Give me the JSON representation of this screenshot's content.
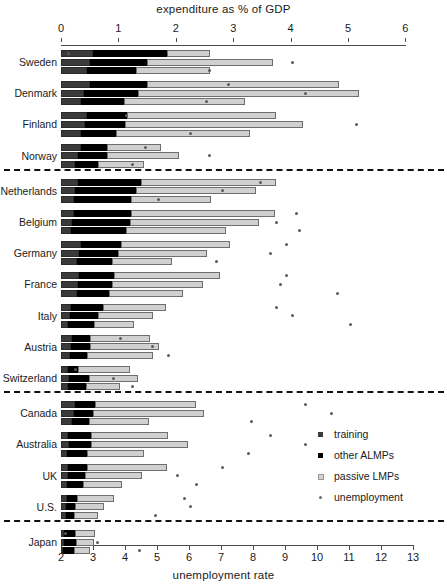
{
  "titles": {
    "top": "expenditure as % of GDP",
    "bottom": "unemployment rate"
  },
  "legend": {
    "items": [
      {
        "key": "training",
        "label": "training"
      },
      {
        "key": "other_almps",
        "label": "other ALMPs"
      },
      {
        "key": "passive_lmps",
        "label": "passive LMPs"
      },
      {
        "key": "unemployment",
        "label": "unemployment"
      }
    ]
  },
  "axes": {
    "top": {
      "label": "expenditure as % of GDP",
      "ticks": [
        0,
        1,
        2,
        3,
        4,
        5,
        6
      ],
      "min": 0,
      "max": 6
    },
    "bottom": {
      "label": "unemployment rate",
      "ticks": [
        2,
        3,
        4,
        5,
        6,
        7,
        8,
        9,
        10,
        11,
        12,
        13
      ],
      "min": 2,
      "max": 13
    }
  },
  "colors": {
    "training": "#3a3a3a",
    "other_almps": "#000000",
    "passive_lmps": "#d0d0d0",
    "unemployment": "#5a5a5a",
    "axis": "#4a4a4a",
    "separator": "#111111",
    "background": "#ffffff"
  },
  "groups": [
    {
      "name": "nordic",
      "countries": [
        "Sweden",
        "Denmark",
        "Finland",
        "Norway"
      ]
    },
    {
      "name": "continental",
      "countries": [
        "Netherlands",
        "Belgium",
        "Germany",
        "France",
        "Italy",
        "Austria",
        "Switzerland"
      ]
    },
    {
      "name": "anglo",
      "countries": [
        "Canada",
        "Australia",
        "UK",
        "U.S."
      ]
    },
    {
      "name": "japan",
      "countries": [
        "Japan"
      ]
    }
  ],
  "chart_data": {
    "type": "bar",
    "orientation": "horizontal",
    "title": "expenditure as % of GDP",
    "xlabel": "expenditure as % of GDP",
    "xlabel_secondary": "unemployment rate",
    "ylabel": "",
    "xlim": [
      0,
      6
    ],
    "xlim_secondary": [
      2,
      13
    ],
    "grid": false,
    "legend_position": "right-middle",
    "stacked": true,
    "series": [
      {
        "name": "training",
        "color": "#3a3a3a"
      },
      {
        "name": "other ALMPs",
        "color": "#000000"
      },
      {
        "name": "passive LMPs",
        "color": "#d0d0d0"
      }
    ],
    "marker_series": {
      "name": "unemployment",
      "color": "#5a5a5a",
      "axis": "bottom"
    },
    "categories": [
      "Sweden",
      "Denmark",
      "Finland",
      "Norway",
      "Netherlands",
      "Belgium",
      "Germany",
      "France",
      "Italy",
      "Austria",
      "Switzerland",
      "Canada",
      "Australia",
      "UK",
      "U.S.",
      "Japan"
    ],
    "bars_per_category": 3,
    "data": [
      {
        "country": "Sweden",
        "bars": [
          {
            "training": 0.55,
            "other_almps": 1.3,
            "passive_lmps": 0.75,
            "unemployment": 2.2
          },
          {
            "training": 0.5,
            "other_almps": 1.0,
            "passive_lmps": 2.2,
            "unemployment": 9.2
          },
          {
            "training": 0.45,
            "other_almps": 0.85,
            "passive_lmps": 1.3,
            "unemployment": 6.6
          }
        ]
      },
      {
        "country": "Denmark",
        "bars": [
          {
            "training": 0.5,
            "other_almps": 1.0,
            "passive_lmps": 3.35,
            "unemployment": 7.2
          },
          {
            "training": 0.4,
            "other_almps": 0.95,
            "passive_lmps": 3.85,
            "unemployment": 9.6
          },
          {
            "training": 0.35,
            "other_almps": 0.75,
            "passive_lmps": 2.1,
            "unemployment": 6.5
          }
        ]
      },
      {
        "country": "Finland",
        "bars": [
          {
            "training": 0.45,
            "other_almps": 0.7,
            "passive_lmps": 2.6,
            "unemployment": 4.0
          },
          {
            "training": 0.42,
            "other_almps": 0.7,
            "passive_lmps": 3.1,
            "unemployment": 11.2
          },
          {
            "training": 0.35,
            "other_almps": 0.6,
            "passive_lmps": 2.35,
            "unemployment": 6.0
          }
        ]
      },
      {
        "country": "Norway",
        "bars": [
          {
            "training": 0.35,
            "other_almps": 0.45,
            "passive_lmps": 0.95,
            "unemployment": 4.6
          },
          {
            "training": 0.3,
            "other_almps": 0.5,
            "passive_lmps": 1.25,
            "unemployment": 6.6
          },
          {
            "training": 0.25,
            "other_almps": 0.4,
            "passive_lmps": 0.8,
            "unemployment": 4.2
          }
        ]
      },
      {
        "country": "Netherlands",
        "bars": [
          {
            "training": 0.3,
            "other_almps": 1.1,
            "passive_lmps": 2.35,
            "unemployment": 8.2
          },
          {
            "training": 0.25,
            "other_almps": 1.05,
            "passive_lmps": 2.1,
            "unemployment": 7.0
          },
          {
            "training": 0.22,
            "other_almps": 1.0,
            "passive_lmps": 1.4,
            "unemployment": 5.0
          }
        ]
      },
      {
        "country": "Belgium",
        "bars": [
          {
            "training": 0.22,
            "other_almps": 1.0,
            "passive_lmps": 2.5,
            "unemployment": 9.3
          },
          {
            "training": 0.2,
            "other_almps": 1.0,
            "passive_lmps": 2.25,
            "unemployment": 8.7
          },
          {
            "training": 0.18,
            "other_almps": 0.95,
            "passive_lmps": 1.75,
            "unemployment": 9.4
          }
        ]
      },
      {
        "country": "Germany",
        "bars": [
          {
            "training": 0.35,
            "other_almps": 0.7,
            "passive_lmps": 1.9,
            "unemployment": 9.0
          },
          {
            "training": 0.32,
            "other_almps": 0.68,
            "passive_lmps": 1.55,
            "unemployment": 8.5
          },
          {
            "training": 0.28,
            "other_almps": 0.6,
            "passive_lmps": 1.05,
            "unemployment": 6.8
          }
        ]
      },
      {
        "country": "France",
        "bars": [
          {
            "training": 0.32,
            "other_almps": 0.6,
            "passive_lmps": 1.85,
            "unemployment": 9.0
          },
          {
            "training": 0.3,
            "other_almps": 0.58,
            "passive_lmps": 1.6,
            "unemployment": 8.8
          },
          {
            "training": 0.28,
            "other_almps": 0.55,
            "passive_lmps": 1.3,
            "unemployment": 10.6
          }
        ]
      },
      {
        "country": "Italy",
        "bars": [
          {
            "training": 0.18,
            "other_almps": 0.55,
            "passive_lmps": 1.1,
            "unemployment": 8.7
          },
          {
            "training": 0.15,
            "other_almps": 0.5,
            "passive_lmps": 0.95,
            "unemployment": 9.2
          },
          {
            "training": 0.12,
            "other_almps": 0.45,
            "passive_lmps": 0.7,
            "unemployment": 11.0
          }
        ]
      },
      {
        "country": "Austria",
        "bars": [
          {
            "training": 0.2,
            "other_almps": 0.3,
            "passive_lmps": 1.05,
            "unemployment": 3.8
          },
          {
            "training": 0.18,
            "other_almps": 0.32,
            "passive_lmps": 1.2,
            "unemployment": 4.8
          },
          {
            "training": 0.16,
            "other_almps": 0.3,
            "passive_lmps": 1.15,
            "unemployment": 5.3
          }
        ]
      },
      {
        "country": "Switzerland",
        "bars": [
          {
            "training": 0.12,
            "other_almps": 0.18,
            "passive_lmps": 0.9,
            "unemployment": 2.4
          },
          {
            "training": 0.14,
            "other_almps": 0.35,
            "passive_lmps": 0.85,
            "unemployment": 3.6
          },
          {
            "training": 0.13,
            "other_almps": 0.3,
            "passive_lmps": 0.6,
            "unemployment": 4.2
          }
        ]
      },
      {
        "country": "Canada",
        "bars": [
          {
            "training": 0.25,
            "other_almps": 0.35,
            "passive_lmps": 1.75,
            "unemployment": 9.6
          },
          {
            "training": 0.23,
            "other_almps": 0.32,
            "passive_lmps": 1.95,
            "unemployment": 10.4
          },
          {
            "training": 0.2,
            "other_almps": 0.28,
            "passive_lmps": 1.05,
            "unemployment": 7.9
          }
        ]
      },
      {
        "country": "Australia",
        "bars": [
          {
            "training": 0.12,
            "other_almps": 0.4,
            "passive_lmps": 1.35,
            "unemployment": 8.5
          },
          {
            "training": 0.14,
            "other_almps": 0.38,
            "passive_lmps": 1.7,
            "unemployment": 9.6
          },
          {
            "training": 0.11,
            "other_almps": 0.34,
            "passive_lmps": 1.0,
            "unemployment": 7.8
          }
        ]
      },
      {
        "country": "UK",
        "bars": [
          {
            "training": 0.13,
            "other_almps": 0.32,
            "passive_lmps": 1.4,
            "unemployment": 7.0
          },
          {
            "training": 0.12,
            "other_almps": 0.3,
            "passive_lmps": 1.0,
            "unemployment": 5.6
          },
          {
            "training": 0.1,
            "other_almps": 0.28,
            "passive_lmps": 0.68,
            "unemployment": 6.2
          }
        ]
      },
      {
        "country": "U.S.",
        "bars": [
          {
            "training": 0.1,
            "other_almps": 0.18,
            "passive_lmps": 0.65,
            "unemployment": 5.8
          },
          {
            "training": 0.09,
            "other_almps": 0.16,
            "passive_lmps": 0.5,
            "unemployment": 6.0
          },
          {
            "training": 0.08,
            "other_almps": 0.15,
            "passive_lmps": 0.42,
            "unemployment": 4.9
          }
        ]
      },
      {
        "country": "Japan",
        "bars": [
          {
            "training": 0.05,
            "other_almps": 0.2,
            "passive_lmps": 0.35,
            "unemployment": 2.1
          },
          {
            "training": 0.05,
            "other_almps": 0.22,
            "passive_lmps": 0.3,
            "unemployment": 3.1
          },
          {
            "training": 0.04,
            "other_almps": 0.18,
            "passive_lmps": 0.28,
            "unemployment": 4.4
          }
        ]
      }
    ]
  },
  "layout": {
    "x0_px": 61,
    "px_per_unit_top": 57.4,
    "px_per_unit_bottom": 32.0,
    "group_top_px": 50,
    "group_pitch_px": 31.2,
    "bar_pitch_px": 8.6,
    "separators_after": [
      "Norway",
      "Switzerland",
      "U.S."
    ]
  }
}
